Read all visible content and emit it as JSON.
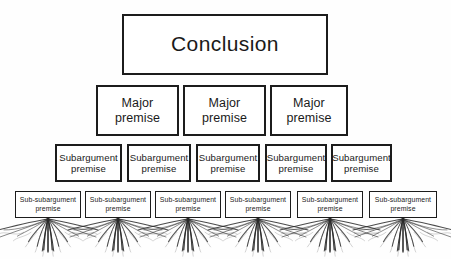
{
  "diagram": {
    "background_color": "#fefefe",
    "stroke_color": "#1c1c1c",
    "text_color": "#1a1a1a",
    "root_color": "#2a2a2a",
    "tiers": [
      {
        "id": "conclusion",
        "label": "Conclusion",
        "count": 1,
        "nodes": [
          {
            "label": "Conclusion",
            "x": 122,
            "y": 14,
            "w": 206,
            "h": 61
          }
        ]
      },
      {
        "id": "major-premise",
        "label": "Major premise",
        "count": 3,
        "nodes": [
          {
            "label": "Major\npremise",
            "x": 96,
            "y": 85,
            "w": 83,
            "h": 51
          },
          {
            "label": "Major\npremise",
            "x": 183,
            "y": 85,
            "w": 83,
            "h": 51
          },
          {
            "label": "Major\npremise",
            "x": 270,
            "y": 85,
            "w": 78,
            "h": 51
          }
        ]
      },
      {
        "id": "subargument-premise",
        "label": "Subargument premise",
        "count": 5,
        "nodes": [
          {
            "label": "Subargument\npremise",
            "x": 55,
            "y": 144,
            "w": 67,
            "h": 38
          },
          {
            "label": "Subargument\npremise",
            "x": 127,
            "y": 144,
            "w": 64,
            "h": 38
          },
          {
            "label": "Subargument\npremise",
            "x": 196,
            "y": 144,
            "w": 64,
            "h": 38
          },
          {
            "label": "Subargument\npremise",
            "x": 265,
            "y": 144,
            "w": 62,
            "h": 38
          },
          {
            "label": "Subargument\npremise",
            "x": 331,
            "y": 144,
            "w": 61,
            "h": 38
          }
        ]
      },
      {
        "id": "sub-subargument-premise",
        "label": "Sub-subargument premise",
        "count": 6,
        "nodes": [
          {
            "label": "Sub-subargument\npremise",
            "x": 15,
            "y": 191,
            "w": 66,
            "h": 27
          },
          {
            "label": "Sub-subargument\npremise",
            "x": 85,
            "y": 191,
            "w": 66,
            "h": 27
          },
          {
            "label": "Sub-subargument\npremise",
            "x": 155,
            "y": 191,
            "w": 66,
            "h": 27
          },
          {
            "label": "Sub-subargument\npremise",
            "x": 225,
            "y": 191,
            "w": 66,
            "h": 27
          },
          {
            "label": "Sub-subargument\npremise",
            "x": 297,
            "y": 191,
            "w": 66,
            "h": 27
          },
          {
            "label": "Sub-subargument\npremise",
            "x": 369,
            "y": 191,
            "w": 68,
            "h": 27
          }
        ]
      }
    ],
    "roots": {
      "description": "fanned tree-root tendrils beneath each sub-subargument premise box",
      "count": 6,
      "centers_x": [
        48,
        118,
        188,
        258,
        330,
        403
      ],
      "top_y": 218,
      "spread": 44,
      "depth": 34
    }
  }
}
